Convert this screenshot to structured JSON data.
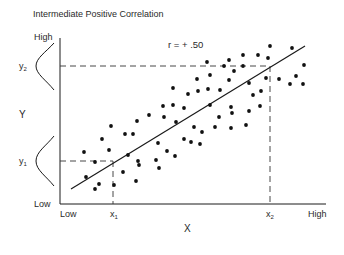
{
  "figure": {
    "title": "Intermediate Positive Correlation",
    "annotation": "r = + .50",
    "y_axis": {
      "label": "Y",
      "high": "High",
      "low": "Low",
      "y1": "y",
      "y1_sub": "1",
      "y2": "y",
      "y2_sub": "2"
    },
    "x_axis": {
      "label": "X",
      "low": "Low",
      "high": "High",
      "x1": "x",
      "x1_sub": "1",
      "x2": "x",
      "x2_sub": "2"
    },
    "colors": {
      "ink": "#1a1a1a",
      "background": "#ffffff"
    }
  },
  "chart_data": {
    "type": "scatter",
    "title": "Intermediate Positive Correlation",
    "xlabel": "X",
    "ylabel": "Y",
    "annotations": [
      "r = + .50"
    ],
    "x_tick_labels": [
      "Low",
      "x1",
      "x2",
      "High"
    ],
    "y_tick_labels": [
      "Low",
      "y1",
      "y2",
      "High"
    ],
    "grid": false,
    "legend": null,
    "correlation_r": 0.5,
    "regression_line": {
      "from_px": [
        71,
        189
      ],
      "to_px": [
        305,
        46
      ]
    },
    "reference_lines": {
      "x1_px": 113,
      "x2_px": 270,
      "y1_px": 161,
      "y2_px": 66
    },
    "axis_px": {
      "x_axis_y": 204,
      "y_axis_x": 60,
      "x_end": 326,
      "y_top": 38
    },
    "points_px": [
      [
        270,
        46
      ],
      [
        292,
        48
      ],
      [
        243,
        55
      ],
      [
        258,
        55
      ],
      [
        229,
        60
      ],
      [
        268,
        58
      ],
      [
        207,
        62
      ],
      [
        224,
        66
      ],
      [
        243,
        66
      ],
      [
        304,
        65
      ],
      [
        234,
        71
      ],
      [
        210,
        75
      ],
      [
        197,
        79
      ],
      [
        229,
        80
      ],
      [
        266,
        78
      ],
      [
        279,
        79
      ],
      [
        296,
        76
      ],
      [
        249,
        83
      ],
      [
        290,
        84
      ],
      [
        303,
        84
      ],
      [
        173,
        88
      ],
      [
        208,
        89
      ],
      [
        198,
        91
      ],
      [
        220,
        90
      ],
      [
        261,
        91
      ],
      [
        188,
        94
      ],
      [
        253,
        95
      ],
      [
        163,
        106
      ],
      [
        173,
        105
      ],
      [
        210,
        105
      ],
      [
        184,
        108
      ],
      [
        231,
        107
      ],
      [
        260,
        106
      ],
      [
        149,
        115
      ],
      [
        164,
        117
      ],
      [
        232,
        113
      ],
      [
        249,
        111
      ],
      [
        137,
        121
      ],
      [
        176,
        122
      ],
      [
        219,
        117
      ],
      [
        111,
        126
      ],
      [
        194,
        127
      ],
      [
        215,
        127
      ],
      [
        231,
        128
      ],
      [
        246,
        125
      ],
      [
        202,
        132
      ],
      [
        125,
        134
      ],
      [
        133,
        134
      ],
      [
        102,
        139
      ],
      [
        184,
        139
      ],
      [
        158,
        143
      ],
      [
        191,
        142
      ],
      [
        200,
        144
      ],
      [
        109,
        150
      ],
      [
        84,
        152
      ],
      [
        167,
        151
      ],
      [
        128,
        155
      ],
      [
        175,
        156
      ],
      [
        95,
        162
      ],
      [
        138,
        161
      ],
      [
        156,
        160
      ],
      [
        139,
        165
      ],
      [
        159,
        168
      ],
      [
        123,
        172
      ],
      [
        86,
        177
      ],
      [
        136,
        181
      ],
      [
        99,
        184
      ],
      [
        95,
        189
      ],
      [
        114,
        185
      ]
    ]
  }
}
